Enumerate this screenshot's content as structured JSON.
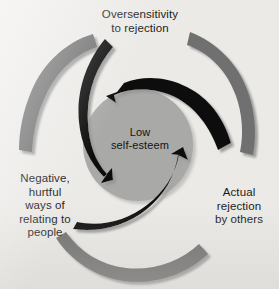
{
  "diagram": {
    "title_text": "Low self-esteem vicious cycle",
    "center": {
      "line1": "Low",
      "line2": "self-esteem",
      "text": "Low\nself-esteem"
    },
    "nodes": [
      {
        "id": "oversensitivity",
        "position": "top",
        "text": "Oversensitivity\nto rejection",
        "line1": "Oversensitivity",
        "line2": "to rejection"
      },
      {
        "id": "actual-rejection",
        "position": "right",
        "text": "Actual\nrejection\nby others",
        "line1": "Actual",
        "line2": "rejection",
        "line3": "by others"
      },
      {
        "id": "negative-relating",
        "position": "left",
        "text": "Negative,\nhurtful\nways of\nrelating to\npeople",
        "line1": "Negative,",
        "line2": "hurtful",
        "line3": "ways of",
        "line4": "relating to",
        "line5": "people"
      }
    ],
    "arcs": {
      "count": 3,
      "color": "#6f6f6f",
      "shadow_color": "#9a9a98",
      "description": "three outer gray curved bands forming a broken ring"
    },
    "arrows": {
      "count": 3,
      "color": "#111111",
      "shadow_color": "#8e8e8c",
      "direction": "inward-spiral-clockwise",
      "description": "three black spiral arrows pointing into the centre circle"
    },
    "center_circle": {
      "fill": "#a9a9a7",
      "shadow": "#bdbdbb"
    },
    "background_color": "#ebeae7"
  }
}
